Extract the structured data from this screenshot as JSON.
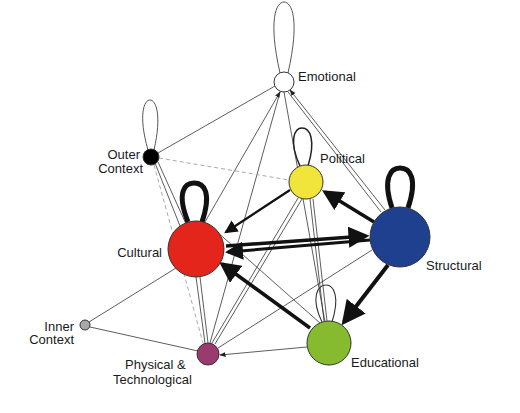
{
  "diagram": {
    "type": "directed-network",
    "nodes": [
      {
        "id": "emotional",
        "label": "Emotional",
        "color": "#ffffff",
        "x": 284,
        "y": 82,
        "r": 10
      },
      {
        "id": "outer_context",
        "label_lines": [
          "Outer",
          "Context"
        ],
        "color": "#000000",
        "x": 151,
        "y": 157,
        "r": 8
      },
      {
        "id": "political",
        "label": "Political",
        "color": "#f1e43a",
        "x": 306,
        "y": 182,
        "r": 17
      },
      {
        "id": "cultural",
        "label": "Cultural",
        "color": "#e4251b",
        "x": 196,
        "y": 249,
        "r": 28
      },
      {
        "id": "structural",
        "label": "Structural",
        "color": "#1f3f8f",
        "x": 400,
        "y": 237,
        "r": 30
      },
      {
        "id": "inner_context",
        "label_lines": [
          "Inner",
          "Context"
        ],
        "color": "#a8a8a8",
        "x": 85,
        "y": 325,
        "r": 5
      },
      {
        "id": "physical_technological",
        "label_lines": [
          "Physical &",
          "Technological"
        ],
        "color": "#9a3a6e",
        "x": 208,
        "y": 354,
        "r": 11
      },
      {
        "id": "educational",
        "label": "Educational",
        "color": "#86bb30",
        "x": 329,
        "y": 343,
        "r": 22
      }
    ],
    "labels": {
      "emotional": "Emotional",
      "outer_context_1": "Outer",
      "outer_context_2": "Context",
      "political": "Political",
      "cultural": "Cultural",
      "structural": "Structural",
      "inner_context_1": "Inner",
      "inner_context_2": "Context",
      "physical_1": "Physical &",
      "physical_2": "Technological",
      "educational": "Educational"
    },
    "self_loops": [
      {
        "node": "emotional",
        "weight": "thin"
      },
      {
        "node": "outer_context",
        "weight": "thin"
      },
      {
        "node": "political",
        "weight": "medium"
      },
      {
        "node": "cultural",
        "weight": "heavy"
      },
      {
        "node": "structural",
        "weight": "heavy"
      },
      {
        "node": "educational",
        "weight": "thin"
      }
    ],
    "edges": [
      {
        "from": "cultural",
        "to": "structural",
        "weight": "heavy"
      },
      {
        "from": "structural",
        "to": "cultural",
        "weight": "heavy"
      },
      {
        "from": "structural",
        "to": "educational",
        "weight": "heavy"
      },
      {
        "from": "educational",
        "to": "cultural",
        "weight": "heavy"
      },
      {
        "from": "structural",
        "to": "political",
        "weight": "heavy"
      },
      {
        "from": "political",
        "to": "cultural",
        "weight": "medium"
      },
      {
        "from": "cultural",
        "to": "emotional",
        "weight": "thin"
      },
      {
        "from": "structural",
        "to": "emotional",
        "weight": "thin"
      },
      {
        "from": "outer_context",
        "to": "emotional",
        "weight": "thin"
      },
      {
        "from": "outer_context",
        "to": "political",
        "weight": "dashed"
      },
      {
        "from": "outer_context",
        "to": "cultural",
        "weight": "thin"
      },
      {
        "from": "outer_context",
        "to": "physical_technological",
        "weight": "dashed"
      },
      {
        "from": "inner_context",
        "to": "cultural",
        "weight": "thin"
      },
      {
        "from": "inner_context",
        "to": "physical_technological",
        "weight": "thin"
      },
      {
        "from": "educational",
        "to": "physical_technological",
        "weight": "thin"
      },
      {
        "from": "political",
        "to": "physical_technological",
        "weight": "thin"
      },
      {
        "from": "structural",
        "to": "physical_technological",
        "weight": "thin"
      },
      {
        "from": "cultural",
        "to": "physical_technological",
        "weight": "thin"
      },
      {
        "from": "political",
        "to": "educational",
        "weight": "thin"
      },
      {
        "from": "emotional",
        "to": "educational",
        "weight": "thin"
      },
      {
        "from": "emotional",
        "to": "physical_technological",
        "weight": "thin"
      }
    ]
  }
}
